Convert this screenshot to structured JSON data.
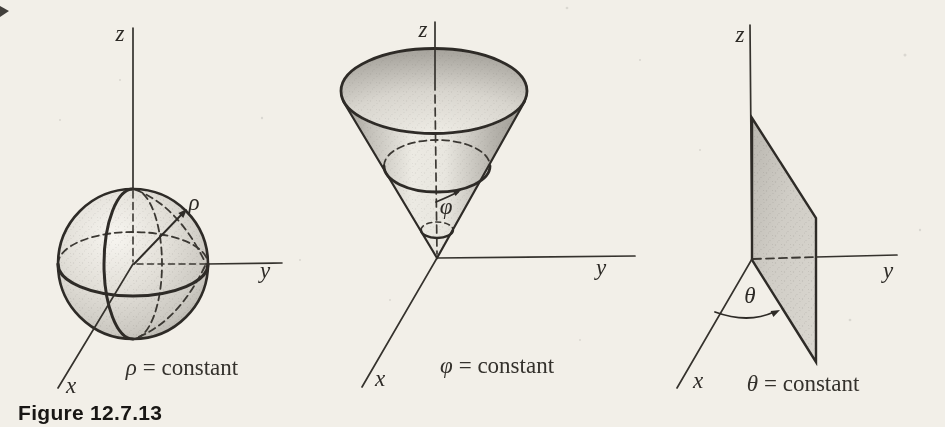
{
  "figure": {
    "label": "Figure 12.7.13"
  },
  "panels": [
    {
      "surface": "sphere",
      "param": "ρ",
      "caption_rest": "= constant",
      "caption_full": "ρ = constant",
      "axis_labels": {
        "x": "x",
        "y": "y",
        "z": "z"
      }
    },
    {
      "surface": "cone",
      "param": "φ",
      "caption_rest": "= constant",
      "caption_full": "φ = constant",
      "axis_labels": {
        "x": "x",
        "y": "y",
        "z": "z"
      }
    },
    {
      "surface": "half-plane",
      "param": "θ",
      "caption_rest": "= constant",
      "caption_full": "θ = constant",
      "axis_labels": {
        "x": "x",
        "y": "y",
        "z": "z"
      }
    }
  ],
  "colors": {
    "ink": "#35322d",
    "paper": "#f2efe8",
    "surface_shade_light": "#eceae3",
    "surface_shade_dark": "#9d9a93"
  }
}
